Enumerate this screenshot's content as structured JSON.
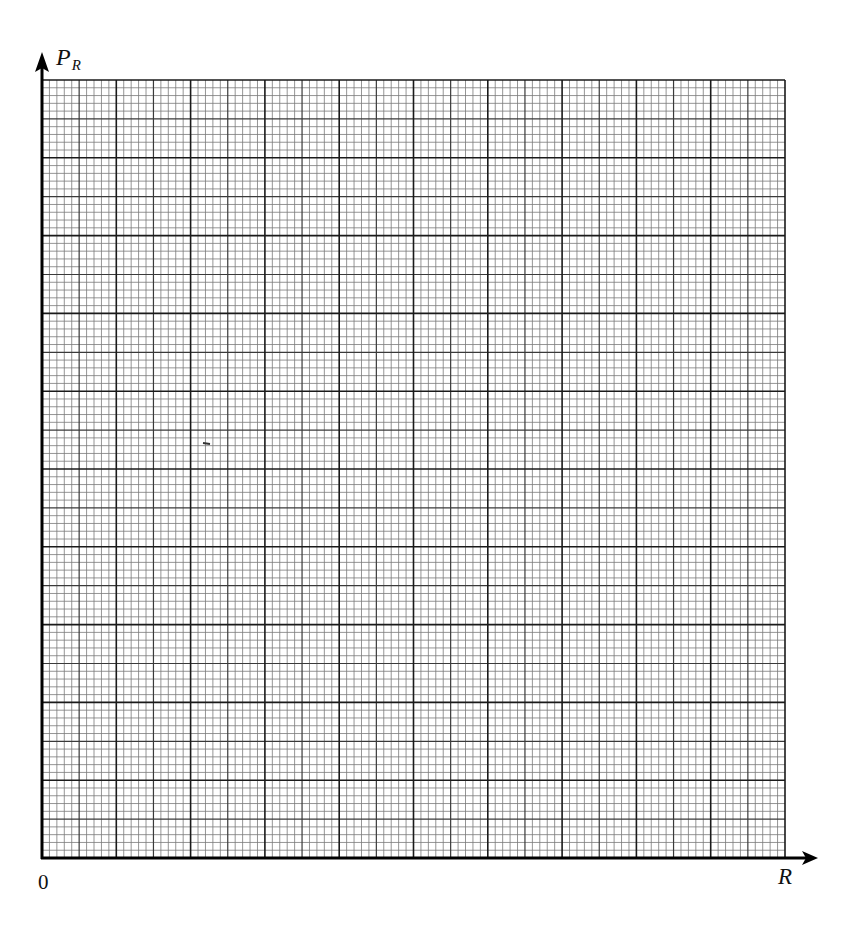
{
  "chart_data": {
    "type": "scatter",
    "title": "",
    "xlabel": "R",
    "ylabel": "P_R",
    "ylabel_main": "P",
    "ylabel_sub": "R",
    "origin_label": "0",
    "grid": true,
    "major_divisions": {
      "x": 10,
      "y": 10
    },
    "minor_per_major": 10,
    "series": [],
    "note": "Blank graph paper with labelled axes; no data plotted"
  },
  "layout": {
    "grid_left": 42,
    "grid_top": 80,
    "grid_right": 785,
    "grid_bottom": 858,
    "colors": {
      "minor": "#7a7a7a",
      "mid": "#3a3a3a",
      "major": "#1a1a1a",
      "axis": "#000000"
    }
  }
}
